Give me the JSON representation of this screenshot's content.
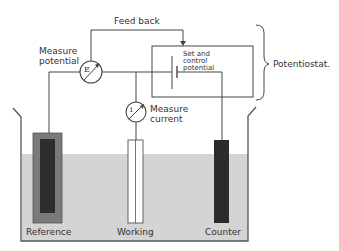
{
  "diagram": {
    "type": "three-electrode electrochemical cell with potentiostat",
    "colors": {
      "line": "#444444",
      "solution": "#d4d4d4",
      "reference_outer": "#7a7a7a",
      "reference_inner": "#2e2e2e",
      "counter": "#2b2b2b",
      "working": "#ffffff",
      "text": "#333333"
    },
    "labels": {
      "feedback": "Feed back",
      "measure_potential_line1": "Measure",
      "measure_potential_line2": "potential",
      "measure_current_line1": "Measure",
      "measure_current_line2": "current",
      "set_control_line1": "Set and",
      "set_control_line2": "control",
      "set_control_line3": "potential",
      "potentiostat": "Potentiostat.",
      "reference": "Reference",
      "working": "Working",
      "counter": "Counter"
    },
    "meters": {
      "voltage_symbol": "E",
      "current_symbol": "i"
    },
    "nodes": [
      {
        "id": "voltmeter",
        "label": "Measure potential",
        "symbol": "E"
      },
      {
        "id": "ammeter",
        "label": "Measure current",
        "symbol": "i"
      },
      {
        "id": "control",
        "label": "Set and control potential"
      },
      {
        "id": "reference_electrode",
        "label": "Reference"
      },
      {
        "id": "working_electrode",
        "label": "Working"
      },
      {
        "id": "counter_electrode",
        "label": "Counter"
      }
    ],
    "edges": [
      {
        "from": "voltmeter",
        "to": "control",
        "label": "Feed back"
      },
      {
        "from": "reference_electrode",
        "to": "voltmeter"
      },
      {
        "from": "voltmeter",
        "to": "control"
      },
      {
        "from": "working_electrode",
        "to": "ammeter"
      },
      {
        "from": "control",
        "to": "counter_electrode"
      }
    ],
    "group": {
      "label": "Potentiostat.",
      "members": [
        "voltmeter",
        "ammeter",
        "control"
      ]
    }
  }
}
